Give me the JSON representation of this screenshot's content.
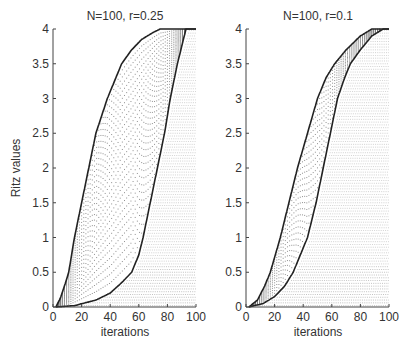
{
  "chart_data": [
    {
      "type": "scatter",
      "title": "N=100, r=0.25",
      "xlabel": "iterations",
      "ylabel": "Ritz values",
      "xlim": [
        0,
        100
      ],
      "ylim": [
        0,
        4
      ],
      "xticks": [
        0,
        20,
        40,
        60,
        80,
        100
      ],
      "yticks": [
        0,
        0.5,
        1,
        1.5,
        2,
        2.5,
        3,
        3.5,
        4
      ],
      "grid": false,
      "series": [
        {
          "name": "largest Ritz value (bold curve)",
          "x": [
            2,
            5,
            8,
            11,
            15,
            20,
            25,
            30,
            38,
            44,
            48,
            55,
            62,
            70,
            75,
            100
          ],
          "y": [
            0,
            0.12,
            0.3,
            0.5,
            1.0,
            1.5,
            2.0,
            2.5,
            3.0,
            3.3,
            3.5,
            3.7,
            3.85,
            3.95,
            4.0,
            4.0
          ]
        },
        {
          "name": "smallest Ritz value (bold curve)",
          "x": [
            2,
            15,
            30,
            40,
            48,
            55,
            60,
            63,
            68,
            73,
            78,
            82,
            87,
            93,
            100
          ],
          "y": [
            0,
            0.02,
            0.1,
            0.2,
            0.35,
            0.5,
            0.75,
            1.0,
            1.5,
            2.0,
            2.5,
            3.0,
            3.5,
            4.0,
            4.0
          ]
        }
      ]
    },
    {
      "type": "scatter",
      "title": "N=100, r=0.1",
      "xlabel": "iterations",
      "ylabel": "",
      "xlim": [
        0,
        100
      ],
      "ylim": [
        0,
        4
      ],
      "xticks": [
        0,
        20,
        40,
        60,
        80,
        100
      ],
      "yticks": [
        0,
        0.5,
        1,
        1.5,
        2,
        2.5,
        3,
        3.5,
        4
      ],
      "grid": false,
      "series": [
        {
          "name": "largest Ritz value (bold curve)",
          "x": [
            2,
            8,
            13,
            17,
            24,
            30,
            36,
            43,
            50,
            56,
            62,
            70,
            80,
            88,
            100
          ],
          "y": [
            0,
            0.1,
            0.3,
            0.5,
            1.0,
            1.5,
            2.0,
            2.5,
            3.0,
            3.3,
            3.5,
            3.7,
            3.9,
            4.0,
            4.0
          ]
        },
        {
          "name": "smallest Ritz value (bold curve)",
          "x": [
            2,
            12,
            20,
            27,
            33,
            38,
            43,
            49,
            54,
            59,
            64,
            69,
            73,
            80,
            88,
            96,
            100
          ],
          "y": [
            0,
            0.05,
            0.15,
            0.3,
            0.5,
            0.75,
            1.0,
            1.5,
            2.0,
            2.5,
            3.0,
            3.3,
            3.5,
            3.7,
            3.9,
            4.0,
            4.0
          ]
        }
      ]
    }
  ],
  "panels": [
    {
      "title": "N=100, r=0.25",
      "xlabel": "iterations",
      "ylabel": "Ritz values",
      "xtick_labels": [
        "0",
        "20",
        "40",
        "60",
        "80",
        "100"
      ],
      "ytick_labels": [
        "0",
        "0.5",
        "1",
        "1.5",
        "2",
        "2.5",
        "3",
        "3.5",
        "4"
      ]
    },
    {
      "title": "N=100, r=0.1",
      "xlabel": "iterations",
      "xtick_labels": [
        "0",
        "20",
        "40",
        "60",
        "80",
        "100"
      ],
      "ytick_labels": [
        "0",
        "0.5",
        "1",
        "1.5",
        "2",
        "2.5",
        "3",
        "3.5",
        "4"
      ]
    }
  ],
  "colors": {
    "curve": "#222222",
    "dots": "#777777",
    "converged": "#9a9a9a",
    "axis": "#444444"
  }
}
